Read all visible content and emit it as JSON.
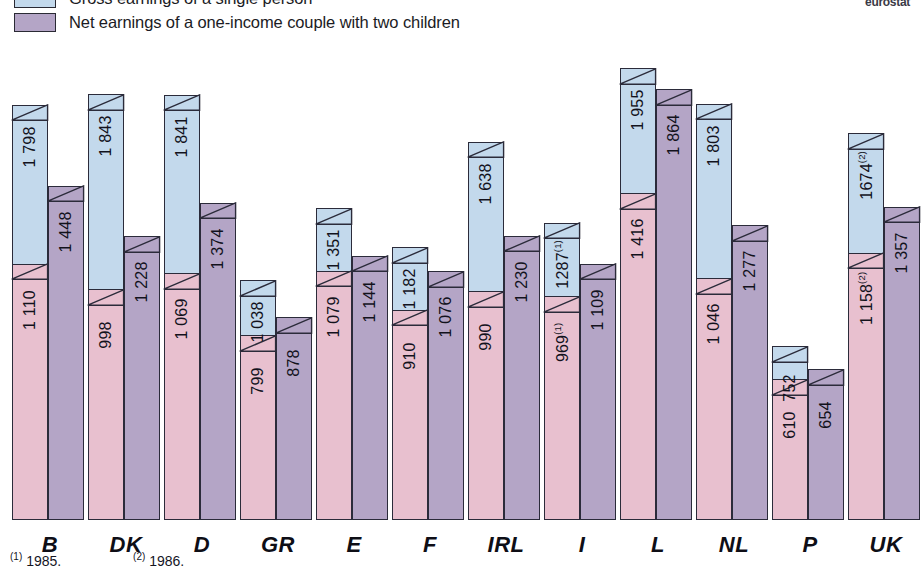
{
  "brand": "eurostat",
  "legend": [
    {
      "key": "gross",
      "label": "Gross earnings of a single person",
      "color": "#c3d9ec"
    },
    {
      "key": "net_couple",
      "label": "Net earnings of a one-income couple with two children",
      "color": "#b4a5c6"
    }
  ],
  "footnotes": [
    {
      "marker": "(1)",
      "text": "1985."
    },
    {
      "marker": "(2)",
      "text": "1986."
    }
  ],
  "chart_data": {
    "type": "bar",
    "title": "",
    "subtitle": "",
    "xlabel": "",
    "ylabel": "",
    "ylim": [
      0,
      2000
    ],
    "grid": false,
    "legend_position": "top-left",
    "categories": [
      "B",
      "DK",
      "D",
      "GR",
      "E",
      "F",
      "IRL",
      "I",
      "L",
      "NL",
      "P",
      "UK"
    ],
    "series": [
      {
        "name": "Gross earnings of a single person",
        "color": "#c3d9ec",
        "values": [
          1798,
          1843,
          1841,
          1038,
          1351,
          1182,
          1638,
          1287,
          1955,
          1803,
          752,
          1674
        ],
        "labels": [
          "1 798",
          "1 843",
          "1 841",
          "1 038",
          "1 351",
          "1 182",
          "1 638",
          "1287",
          "1 955",
          "1 803",
          "752",
          "1674"
        ],
        "label_notes": [
          "",
          "",
          "",
          "",
          "",
          "",
          "",
          "(1)",
          "",
          "",
          "",
          "(2)"
        ]
      },
      {
        "name": "Net earnings of a single person",
        "color": "#e8c0cf",
        "values": [
          1110,
          998,
          1069,
          799,
          1079,
          910,
          990,
          969,
          1416,
          1046,
          610,
          1158
        ],
        "labels": [
          "1 110",
          "998",
          "1 069",
          "799",
          "1 079",
          "910",
          "990",
          "969",
          "1 416",
          "1 046",
          "610",
          "1 158"
        ],
        "label_notes": [
          "",
          "",
          "",
          "",
          "",
          "",
          "",
          "(1)",
          "",
          "",
          "",
          "(2)"
        ]
      },
      {
        "name": "Net earnings of a one-income couple with two children",
        "color": "#b4a5c6",
        "values": [
          1448,
          1228,
          1374,
          878,
          1144,
          1076,
          1230,
          1109,
          1864,
          1277,
          654,
          1357
        ],
        "labels": [
          "1 448",
          "1 228",
          "1 374",
          "878",
          "1 144",
          "1 076",
          "1 230",
          "1 109",
          "1 864",
          "1 277",
          "654",
          "1 357"
        ],
        "label_notes": [
          "",
          "",
          "",
          "",
          "",
          "",
          "",
          "",
          "",
          "",
          "",
          ""
        ]
      }
    ]
  }
}
